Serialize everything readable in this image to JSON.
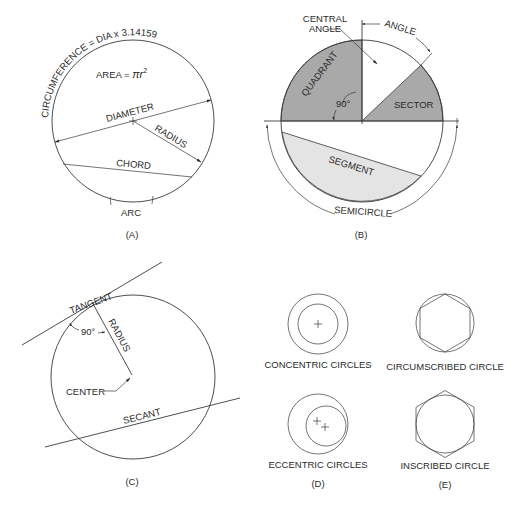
{
  "figure": {
    "panels": {
      "A": {
        "caption": "(A)",
        "labels": {
          "circumference": "CIRCUMFERENCE = DIA x 3.14159",
          "area": "AREA = ",
          "area_formula": "πr",
          "area_exponent": "2",
          "diameter": "DIAMETER",
          "radius": "RADIUS",
          "chord": "CHORD",
          "arc": "ARC"
        }
      },
      "B": {
        "caption": "(B)",
        "labels": {
          "central_angle_line1": "CENTRAL",
          "central_angle_line2": "ANGLE",
          "angle": "ANGLE",
          "quadrant": "QUADRANT",
          "ninety": "90°",
          "sector": "SECTOR",
          "segment": "SEGMENT",
          "semicircle": "SEMICIRCLE"
        },
        "colors": {
          "quadrant_fill": "#a9a9a9",
          "sector_fill": "#a9a9a9",
          "segment_fill": "#e4e4e4"
        }
      },
      "C": {
        "caption": "(C)",
        "labels": {
          "tangent": "TANGENT",
          "ninety": "90°",
          "radius": "RADIUS",
          "center": "CENTER",
          "secant": "SECANT"
        }
      },
      "D": {
        "caption": "(D)",
        "labels": {
          "concentric": "CONCENTRIC CIRCLES",
          "eccentric": "ECCENTRIC CIRCLES"
        }
      },
      "E": {
        "caption": "(E)",
        "labels": {
          "circumscribed": "CIRCUMSCRIBED CIRCLE",
          "inscribed": "INSCRIBED CIRCLE"
        }
      }
    }
  }
}
